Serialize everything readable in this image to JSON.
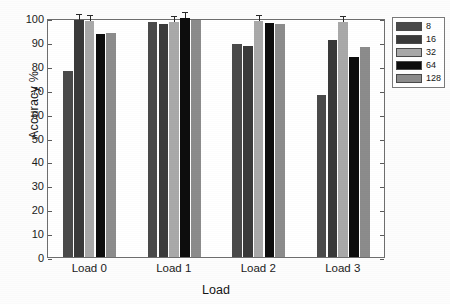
{
  "chart_data": {
    "type": "bar",
    "title": "",
    "xlabel": "Load",
    "ylabel": "Accuracy %",
    "categories": [
      "Load 0",
      "Load 1",
      "Load 2",
      "Load 3"
    ],
    "ylim": [
      0,
      100
    ],
    "yticks": [
      0,
      10,
      20,
      30,
      40,
      50,
      60,
      70,
      80,
      90,
      100
    ],
    "grid": false,
    "legend_position": "top-right-outside",
    "series": [
      {
        "name": "8",
        "color": "#4a4a4a",
        "values": [
          78.0,
          98.5,
          89.0,
          67.8
        ]
      },
      {
        "name": "16",
        "color": "#3a3a3a",
        "values": [
          99.0,
          97.4,
          88.5,
          91.0
        ]
      },
      {
        "name": "32",
        "color": "#a9a9a9",
        "values": [
          98.6,
          98.5,
          98.6,
          98.2
        ]
      },
      {
        "name": "64",
        "color": "#0d0d0d",
        "values": [
          93.5,
          99.8,
          97.9,
          83.5
        ]
      },
      {
        "name": "128",
        "color": "#8c8c8c",
        "values": [
          93.8,
          99.3,
          97.7,
          87.8
        ]
      }
    ]
  },
  "legend": {
    "items": [
      {
        "label": "8"
      },
      {
        "label": "16"
      },
      {
        "label": "32"
      },
      {
        "label": "64"
      },
      {
        "label": "128"
      }
    ]
  },
  "axes": {
    "y_tick_labels": [
      "0",
      "10",
      "20",
      "30",
      "40",
      "50",
      "60",
      "70",
      "80",
      "90",
      "100"
    ],
    "x_tick_labels": [
      "Load 0",
      "Load 1",
      "Load 2",
      "Load 3"
    ],
    "y_title": "Accuracy %",
    "x_title": "Load"
  }
}
